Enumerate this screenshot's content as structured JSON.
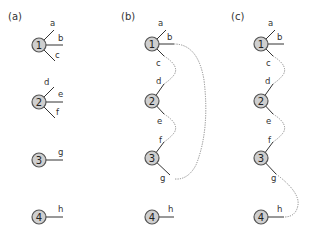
{
  "panels": [
    {
      "label": "(a)",
      "nodes": [
        "1",
        "2",
        "3",
        "4"
      ],
      "stubs": {
        "1": [
          "a",
          "b",
          "c"
        ],
        "2": [
          "d",
          "e",
          "f"
        ],
        "3": [
          "g"
        ],
        "4": [
          "h"
        ]
      },
      "connections": []
    },
    {
      "label": "(b)",
      "nodes": [
        "1",
        "2",
        "3",
        "4"
      ],
      "stubs": {
        "1": [
          "a",
          "b",
          "c"
        ],
        "2": [
          "d",
          "e",
          "f"
        ],
        "3": [
          "g"
        ],
        "4": [
          "h"
        ]
      },
      "connections": [
        [
          "c",
          "d"
        ],
        [
          "e",
          "f"
        ],
        [
          "b",
          "g"
        ]
      ]
    },
    {
      "label": "(c)",
      "nodes": [
        "1",
        "2",
        "3",
        "4"
      ],
      "stubs": {
        "1": [
          "a",
          "b",
          "c"
        ],
        "2": [
          "d",
          "e",
          "f"
        ],
        "3": [
          "g"
        ],
        "4": [
          "h"
        ]
      },
      "connections": [
        [
          "c",
          "d"
        ],
        [
          "e",
          "f"
        ],
        [
          "g",
          "h"
        ]
      ]
    }
  ]
}
